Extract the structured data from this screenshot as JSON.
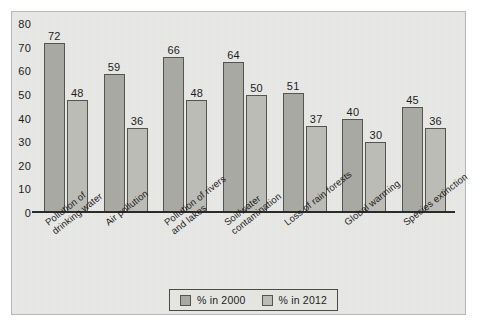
{
  "chart_data": {
    "type": "bar",
    "title": "",
    "subtitle": "",
    "xlabel": "",
    "ylabel": "",
    "ylim": [
      0,
      80
    ],
    "yticks": [
      0,
      10,
      20,
      30,
      40,
      50,
      60,
      70,
      80
    ],
    "grid": false,
    "legend_position": "bottom",
    "categories": [
      "Pollution of\ndrinking water",
      "Air pollution",
      "Pollution of rivers\nand lakes",
      "Soil/water\ncontamination",
      "Loss of rain forests",
      "Global warming",
      "Species extinction"
    ],
    "series": [
      {
        "name": "% in 2000",
        "color": "#a9a9a4",
        "values": [
          72,
          59,
          66,
          64,
          51,
          40,
          45
        ]
      },
      {
        "name": "% in 2012",
        "color": "#bcbcb7",
        "values": [
          48,
          36,
          48,
          50,
          37,
          30,
          36
        ]
      }
    ]
  },
  "legend": {
    "items": [
      {
        "label": "% in 2000"
      },
      {
        "label": "% in 2012"
      }
    ]
  },
  "colors": {
    "panel_background": "#e9e9e7",
    "panel_border": "#b9b9b7",
    "axis": "#2b2b2b",
    "series_2000": "#a9a9a4",
    "series_2012": "#bcbcb7",
    "bar_outline": "#55554f",
    "text": "#1d1d1d"
  }
}
